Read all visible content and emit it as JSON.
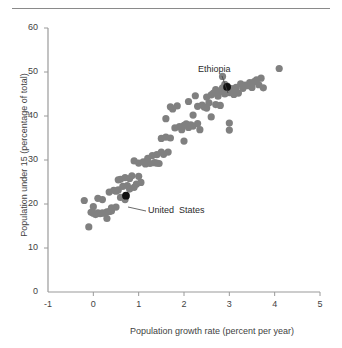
{
  "figure": {
    "top_rule": true,
    "background_color": "#ffffff"
  },
  "chart_data": {
    "type": "scatter",
    "title": "",
    "xlabel": "Population growth rate (percent per year)",
    "ylabel": "Population under 15 (percentage of total)",
    "xlim": [
      -1,
      5
    ],
    "ylim": [
      0,
      60
    ],
    "xticks": [
      -1,
      0,
      1,
      2,
      3,
      4,
      5
    ],
    "yticks": [
      0,
      10,
      20,
      30,
      40,
      50,
      60
    ],
    "xtick_labels": [
      "-1",
      "0",
      "1",
      "2",
      "3",
      "4",
      "5"
    ],
    "ytick_labels": [
      "0",
      "10",
      "20",
      "30",
      "40",
      "50",
      "60"
    ],
    "grid": false,
    "legend": "none",
    "marker_color": "#808080",
    "highlight_color": "#111111",
    "marker_radius_px": 3.6,
    "points": [
      [
        -0.2,
        20.8
      ],
      [
        -0.1,
        14.8
      ],
      [
        -0.05,
        18.1
      ],
      [
        0.0,
        17.9
      ],
      [
        0.0,
        19.4
      ],
      [
        0.05,
        17.6
      ],
      [
        0.1,
        18.0
      ],
      [
        0.1,
        21.3
      ],
      [
        0.15,
        17.8
      ],
      [
        0.2,
        18.0
      ],
      [
        0.2,
        21.0
      ],
      [
        0.25,
        17.9
      ],
      [
        0.3,
        18.2
      ],
      [
        0.3,
        16.7
      ],
      [
        0.35,
        18.3
      ],
      [
        0.35,
        22.7
      ],
      [
        0.4,
        18.4
      ],
      [
        0.4,
        19.1
      ],
      [
        0.45,
        23.1
      ],
      [
        0.5,
        19.3
      ],
      [
        0.5,
        22.9
      ],
      [
        0.55,
        23.2
      ],
      [
        0.55,
        25.5
      ],
      [
        0.6,
        21.5
      ],
      [
        0.6,
        25.6
      ],
      [
        0.65,
        24.0
      ],
      [
        0.7,
        21.0
      ],
      [
        0.7,
        26.0
      ],
      [
        0.75,
        24.2
      ],
      [
        0.8,
        25.8
      ],
      [
        0.8,
        23.4
      ],
      [
        0.85,
        26.4
      ],
      [
        0.9,
        23.8
      ],
      [
        0.9,
        29.8
      ],
      [
        0.95,
        24.5
      ],
      [
        1.0,
        26.3
      ],
      [
        1.0,
        29.3
      ],
      [
        1.05,
        24.9
      ],
      [
        1.1,
        29.6
      ],
      [
        1.15,
        29.1
      ],
      [
        1.2,
        30.4
      ],
      [
        1.25,
        29.2
      ],
      [
        1.3,
        31.0
      ],
      [
        1.35,
        29.4
      ],
      [
        1.4,
        29.3
      ],
      [
        1.4,
        31.2
      ],
      [
        1.45,
        29.2
      ],
      [
        1.5,
        31.8
      ],
      [
        1.5,
        34.9
      ],
      [
        1.55,
        31.3
      ],
      [
        1.6,
        35.2
      ],
      [
        1.6,
        39.4
      ],
      [
        1.65,
        31.8
      ],
      [
        1.7,
        35.0
      ],
      [
        1.7,
        42.1
      ],
      [
        1.75,
        41.6
      ],
      [
        1.8,
        37.3
      ],
      [
        1.85,
        42.3
      ],
      [
        1.9,
        37.6
      ],
      [
        1.95,
        36.9
      ],
      [
        2.0,
        37.9
      ],
      [
        2.0,
        34.3
      ],
      [
        2.05,
        38.2
      ],
      [
        2.1,
        37.4
      ],
      [
        2.1,
        43.3
      ],
      [
        2.15,
        38.0
      ],
      [
        2.2,
        37.7
      ],
      [
        2.2,
        40.2
      ],
      [
        2.25,
        44.6
      ],
      [
        2.3,
        38.3
      ],
      [
        2.3,
        42.2
      ],
      [
        2.35,
        36.9
      ],
      [
        2.4,
        42.5
      ],
      [
        2.45,
        42.0
      ],
      [
        2.5,
        41.8
      ],
      [
        2.5,
        44.3
      ],
      [
        2.55,
        43.0
      ],
      [
        2.6,
        44.8
      ],
      [
        2.6,
        39.8
      ],
      [
        2.65,
        45.2
      ],
      [
        2.7,
        42.6
      ],
      [
        2.7,
        46.0
      ],
      [
        2.75,
        44.5
      ],
      [
        2.8,
        45.5
      ],
      [
        2.8,
        42.4
      ],
      [
        2.85,
        46.4
      ],
      [
        2.85,
        49.0
      ],
      [
        2.9,
        45.0
      ],
      [
        2.9,
        47.2
      ],
      [
        2.95,
        46.8
      ],
      [
        3.0,
        45.3
      ],
      [
        3.0,
        38.4
      ],
      [
        3.0,
        36.8
      ],
      [
        3.05,
        46.2
      ],
      [
        3.1,
        45.6
      ],
      [
        3.1,
        44.9
      ],
      [
        3.15,
        46.5
      ],
      [
        3.2,
        45.2
      ],
      [
        3.25,
        47.3
      ],
      [
        3.3,
        46.3
      ],
      [
        3.35,
        47.0
      ],
      [
        3.4,
        46.9
      ],
      [
        3.45,
        47.6
      ],
      [
        3.5,
        46.5
      ],
      [
        3.55,
        47.8
      ],
      [
        3.6,
        48.2
      ],
      [
        3.65,
        47.1
      ],
      [
        3.7,
        48.6
      ],
      [
        3.75,
        46.4
      ],
      [
        4.1,
        50.8
      ]
    ],
    "annotations": [
      {
        "label": "Ethiopia",
        "x": 2.95,
        "y": 46.6,
        "label_px": {
          "left": 198,
          "top": 64
        },
        "leader": {
          "x1": 222,
          "y1": 76,
          "x2": 228,
          "y2": 93
        }
      },
      {
        "label": "United  States",
        "x": 0.72,
        "y": 21.9,
        "label_px": {
          "left": 148,
          "top": 205
        },
        "leader": {
          "x1": 128,
          "y1": 207,
          "x2": 146,
          "y2": 211
        }
      }
    ]
  }
}
